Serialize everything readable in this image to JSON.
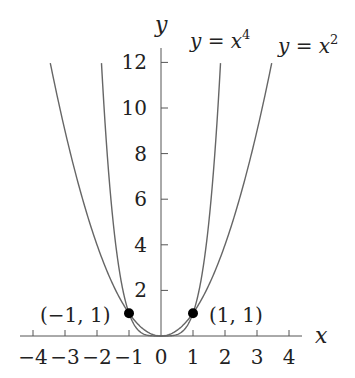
{
  "chart_data": {
    "type": "line",
    "title": "",
    "xlabel": "x",
    "ylabel": "y",
    "xlim": [
      -4.5,
      4.5
    ],
    "ylim": [
      0,
      12.5
    ],
    "x_ticks": [
      -4,
      -3,
      -2,
      -1,
      0,
      1,
      2,
      3,
      4
    ],
    "x_tick_labels": [
      "−4",
      "−3",
      "−2",
      "−1",
      "0",
      "1",
      "2",
      "3",
      "4"
    ],
    "y_ticks": [
      2,
      4,
      6,
      8,
      10,
      12
    ],
    "y_tick_labels": [
      "2",
      "4",
      "6",
      "8",
      "10",
      "12"
    ],
    "grid": false,
    "series": [
      {
        "name": "y = x^2",
        "label_base": "y = x",
        "label_exp": "2",
        "function": "x^2",
        "x_range": [
          -3.46,
          3.46
        ],
        "color": "#666666"
      },
      {
        "name": "y = x^4",
        "label_base": "y = x",
        "label_exp": "4",
        "function": "x^4",
        "x_range": [
          -1.86,
          1.86
        ],
        "color": "#666666"
      }
    ],
    "points": [
      {
        "x": -1,
        "y": 1,
        "label": "(−1, 1)"
      },
      {
        "x": 1,
        "y": 1,
        "label": "(1, 1)"
      }
    ]
  }
}
